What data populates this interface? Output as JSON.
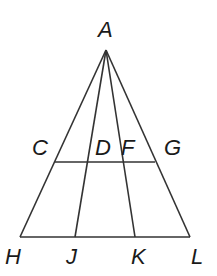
{
  "diagram": {
    "type": "geometry-triangle",
    "line_color": "#333333",
    "label_color": "#1a1a1a",
    "points": {
      "A": {
        "label": "A",
        "x": 106,
        "y": 50
      },
      "C": {
        "label": "C",
        "x": 55,
        "y": 162
      },
      "D": {
        "label": "D",
        "x": 90,
        "y": 162
      },
      "F": {
        "label": "F",
        "x": 124,
        "y": 162
      },
      "G": {
        "label": "G",
        "x": 155,
        "y": 162
      },
      "H": {
        "label": "H",
        "x": 20,
        "y": 237
      },
      "J": {
        "label": "J",
        "x": 75,
        "y": 237
      },
      "K": {
        "label": "K",
        "x": 135,
        "y": 237
      },
      "L": {
        "label": "L",
        "x": 190,
        "y": 237
      }
    },
    "segments": [
      "AH",
      "AJ",
      "AK",
      "AL",
      "CG",
      "HL"
    ],
    "labels": {
      "A": "A",
      "C": "C",
      "D": "D",
      "F": "F",
      "G": "G",
      "H": "H",
      "J": "J",
      "K": "K",
      "L": "L"
    }
  }
}
